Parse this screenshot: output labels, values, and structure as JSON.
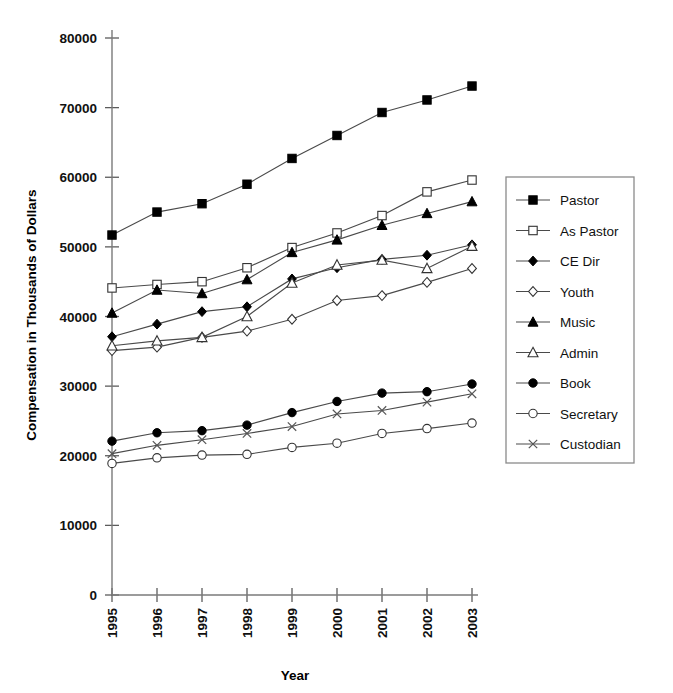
{
  "chart_data": {
    "type": "line",
    "title": "",
    "xlabel": "Year",
    "ylabel": "Compensation in Thousands of Dollars",
    "categories": [
      "1995",
      "1996",
      "1997",
      "1998",
      "1999",
      "2000",
      "2001",
      "2002",
      "2003"
    ],
    "x": [
      1995,
      1996,
      1997,
      1998,
      1999,
      2000,
      2001,
      2002,
      2003
    ],
    "ylim": [
      0,
      80000
    ],
    "xlim": [
      1995,
      2003
    ],
    "yticks": [
      "0",
      "10000",
      "20000",
      "30000",
      "40000",
      "50000",
      "60000",
      "70000",
      "80000"
    ],
    "ytick_values": [
      0,
      10000,
      20000,
      30000,
      40000,
      50000,
      60000,
      70000,
      80000
    ],
    "grid": false,
    "legend_position": "right",
    "series": [
      {
        "name": "Pastor",
        "marker": "filled-square",
        "values": [
          51700,
          55000,
          56200,
          59000,
          62700,
          66000,
          69300,
          71100,
          73100
        ]
      },
      {
        "name": "As Pastor",
        "marker": "open-square",
        "values": [
          44100,
          44600,
          45000,
          47000,
          49900,
          52000,
          54500,
          57900,
          59600
        ]
      },
      {
        "name": "CE Dir",
        "marker": "filled-diamond",
        "values": [
          37100,
          38900,
          40700,
          41400,
          45400,
          47000,
          48200,
          48800,
          50300
        ]
      },
      {
        "name": "Youth",
        "marker": "open-diamond",
        "values": [
          35100,
          35600,
          37000,
          37900,
          39600,
          42300,
          43000,
          44900,
          46900
        ]
      },
      {
        "name": "Music",
        "marker": "filled-triangle",
        "values": [
          40500,
          43800,
          43300,
          45300,
          49200,
          51000,
          53100,
          54800,
          56500
        ]
      },
      {
        "name": "Admin",
        "marker": "open-triangle",
        "values": [
          35800,
          36500,
          37000,
          40000,
          44800,
          47400,
          48100,
          46900,
          50100
        ]
      },
      {
        "name": "Book",
        "marker": "filled-circle",
        "values": [
          22100,
          23300,
          23600,
          24400,
          26200,
          27800,
          29000,
          29200,
          30300
        ]
      },
      {
        "name": "Secretary",
        "marker": "open-circle",
        "values": [
          18900,
          19700,
          20100,
          20200,
          21200,
          21800,
          23200,
          23900,
          24700
        ]
      },
      {
        "name": "Custodian",
        "marker": "cross",
        "values": [
          20300,
          21500,
          22300,
          23200,
          24200,
          26000,
          26500,
          27700,
          28900
        ]
      }
    ]
  },
  "axes": {
    "y_title": "Compensation in Thousands of Dollars",
    "x_title": "Year"
  },
  "legend": {
    "items": [
      {
        "label": "Pastor"
      },
      {
        "label": "As Pastor"
      },
      {
        "label": "CE Dir"
      },
      {
        "label": "Youth"
      },
      {
        "label": "Music"
      },
      {
        "label": "Admin"
      },
      {
        "label": "Book"
      },
      {
        "label": "Secretary"
      },
      {
        "label": "Custodian"
      }
    ]
  },
  "colors": {
    "ink": "#000000",
    "line": "#4a4a4a",
    "axis": "#7a7a7a",
    "background": "#ffffff"
  }
}
